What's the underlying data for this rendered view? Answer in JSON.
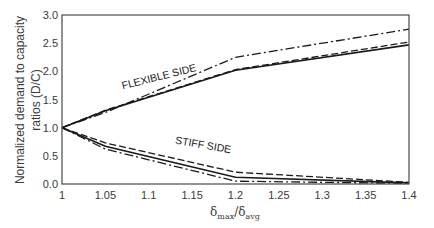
{
  "chart_data": {
    "type": "line",
    "title": "",
    "xlabel": "δmax/δavg",
    "xlabel_main": "δ",
    "xlabel_sub1": "max",
    "xlabel_sep": "/δ",
    "xlabel_sub2": "avg",
    "ylabel": "Normalized demand to capacity ratios (D/C)",
    "ylabel_line1": "Normalized demand to capacity",
    "ylabel_line2": "ratios (D/C)",
    "xlim": [
      1,
      1.4
    ],
    "ylim": [
      0,
      3.0
    ],
    "x_ticks": [
      "1",
      "1.05",
      "1.1",
      "1.15",
      "1.2",
      "1.25",
      "1.3",
      "1.35",
      "1.4"
    ],
    "y_ticks": [
      "0.0",
      "0.5",
      "1.0",
      "1.5",
      "2.0",
      "2.5",
      "3.0"
    ],
    "grid": false,
    "legend": null,
    "annotations": [
      {
        "text": "FLEXIBLE SIDE",
        "x": 1.07,
        "y": 1.68,
        "rotation": -14
      },
      {
        "text": "STIFF SIDE",
        "x": 1.13,
        "y": 0.72,
        "rotation": 10
      }
    ],
    "x": [
      1.0,
      1.05,
      1.2,
      1.4
    ],
    "series": [
      {
        "name": "Flexible side - solid",
        "group": "flexible",
        "style": "solid",
        "values": [
          1.0,
          1.3,
          2.02,
          2.47
        ]
      },
      {
        "name": "Flexible side - dashed",
        "group": "flexible",
        "style": "dashed",
        "values": [
          1.0,
          1.31,
          2.03,
          2.52
        ]
      },
      {
        "name": "Flexible side - dash-dot",
        "group": "flexible",
        "style": "dashdot",
        "values": [
          1.0,
          1.27,
          2.25,
          2.75
        ]
      },
      {
        "name": "Stiff side - solid",
        "group": "stiff",
        "style": "solid",
        "values": [
          1.0,
          0.67,
          0.12,
          0.02
        ]
      },
      {
        "name": "Stiff side - dashed",
        "group": "stiff",
        "style": "dashed",
        "values": [
          1.0,
          0.73,
          0.21,
          0.03
        ]
      },
      {
        "name": "Stiff side - dash-dot",
        "group": "stiff",
        "style": "dashdot",
        "values": [
          1.0,
          0.62,
          0.05,
          0.01
        ]
      }
    ]
  }
}
